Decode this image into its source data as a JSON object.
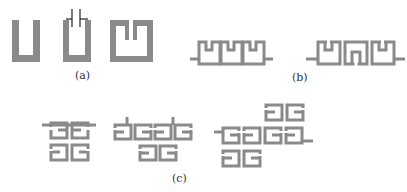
{
  "figure": {
    "stroke_color": "#8a8a8a",
    "background": "#ffffff",
    "panels": [
      {
        "id": "a",
        "label": "(a)",
        "description": "Single resonator shapes: U-shaped resonator, capacitively loaded U resonator, split ring resonator"
      },
      {
        "id": "b",
        "label": "(b)",
        "description": "Cascaded three-resonator chains with feed lines"
      },
      {
        "id": "c",
        "label": "(c)",
        "description": "Two-dimensional coupled resonator arrays"
      }
    ]
  }
}
